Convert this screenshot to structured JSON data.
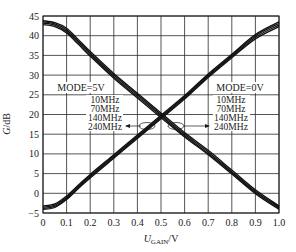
{
  "chart_data": {
    "type": "line",
    "title": "",
    "xlabel": "U_GAIN/V",
    "xlabel_main": "U",
    "xlabel_sub": "GAIN",
    "xlabel_unit": "/V",
    "ylabel": "G/dB",
    "xlim": [
      0,
      1.0
    ],
    "ylim": [
      -5,
      45
    ],
    "grid": true,
    "x_ticks": [
      0,
      0.1,
      0.2,
      0.3,
      0.4,
      0.5,
      0.6,
      0.7,
      0.8,
      0.9,
      1.0
    ],
    "x_tick_labels": [
      "0",
      "0.1",
      "0.2",
      "0.3",
      "0.4",
      "0.5",
      "0.6",
      "0.7",
      "0.8",
      "0.9",
      "1.0"
    ],
    "y_ticks": [
      45,
      40,
      35,
      30,
      25,
      20,
      15,
      10,
      5,
      0,
      -5
    ],
    "y_tick_labels": [
      "45",
      "40",
      "35",
      "30",
      "25",
      "20",
      "15",
      "10",
      "5",
      "0",
      "-5"
    ],
    "x": [
      0,
      0.05,
      0.1,
      0.15,
      0.2,
      0.3,
      0.4,
      0.5,
      0.6,
      0.7,
      0.8,
      0.9,
      1.0
    ],
    "series": [
      {
        "name": "MODE=5V, 10MHz",
        "group": "MODE=5V",
        "values": [
          43.8,
          43.3,
          41.9,
          39.0,
          36.0,
          30.4,
          25.4,
          20.4,
          15.4,
          10.9,
          5.9,
          0.9,
          -3.2
        ]
      },
      {
        "name": "MODE=5V, 70MHz",
        "group": "MODE=5V",
        "values": [
          43.5,
          43.0,
          41.5,
          38.6,
          35.6,
          30.0,
          25.0,
          20.0,
          15.0,
          10.5,
          5.5,
          0.5,
          -3.5
        ]
      },
      {
        "name": "MODE=5V, 140MHz",
        "group": "MODE=5V",
        "values": [
          43.2,
          42.7,
          41.1,
          38.2,
          35.2,
          29.6,
          24.6,
          19.6,
          14.6,
          10.1,
          5.2,
          0.2,
          -3.8
        ]
      },
      {
        "name": "MODE=5V, 240MHz",
        "group": "MODE=5V",
        "values": [
          42.8,
          42.3,
          40.7,
          37.8,
          34.8,
          29.2,
          24.2,
          19.2,
          14.3,
          9.8,
          4.9,
          -0.1,
          -4.1
        ]
      },
      {
        "name": "MODE=0V, 10MHz",
        "group": "MODE=0V",
        "values": [
          -3.2,
          -2.7,
          -0.7,
          2.1,
          4.8,
          9.8,
          14.8,
          19.8,
          24.8,
          30.3,
          35.3,
          40.3,
          43.5
        ]
      },
      {
        "name": "MODE=0V, 70MHz",
        "group": "MODE=0V",
        "values": [
          -3.5,
          -3.0,
          -1.0,
          1.8,
          4.5,
          9.5,
          14.5,
          19.5,
          24.5,
          30.0,
          35.0,
          40.0,
          43.1
        ]
      },
      {
        "name": "MODE=0V, 140MHz",
        "group": "MODE=0V",
        "values": [
          -3.8,
          -3.3,
          -1.3,
          1.5,
          4.2,
          9.2,
          14.2,
          19.2,
          24.2,
          29.7,
          34.7,
          39.6,
          42.7
        ]
      },
      {
        "name": "MODE=0V, 240MHz",
        "group": "MODE=0V",
        "values": [
          -4.1,
          -3.6,
          -1.6,
          1.2,
          3.9,
          8.9,
          13.9,
          18.9,
          23.9,
          29.4,
          34.4,
          39.2,
          42.3
        ]
      }
    ],
    "annotations": [
      {
        "text": "MODE=5V",
        "lines": [
          "10MHz",
          "70MHz",
          "140MHz",
          "240MHz"
        ],
        "points_to": "decreasing curves"
      },
      {
        "text": "MODE=0V",
        "lines": [
          "10MHz",
          "70MHz",
          "140MHz",
          "240MHz"
        ],
        "points_to": "increasing curves"
      }
    ],
    "legend_position": "inside annotations"
  },
  "labels": {
    "ylabel_italic": "G",
    "ylabel_unit": "/dB",
    "left_mode": "MODE=5V",
    "right_mode": "MODE=0V",
    "freqs": [
      "10MHz",
      "70MHz",
      "140MHz",
      "240MHz"
    ]
  }
}
